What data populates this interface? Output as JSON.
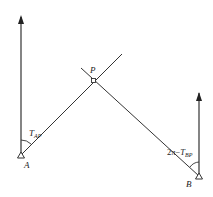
{
  "diagram": {
    "points": {
      "A": {
        "label": "A"
      },
      "B": {
        "label": "B"
      },
      "P": {
        "label": "P"
      }
    },
    "angles": {
      "at_A": {
        "main": "T",
        "sub": "AP"
      },
      "at_B": {
        "prefix": "2π−",
        "main": "T",
        "sub": "BP"
      }
    },
    "colors": {
      "line": "#333333",
      "background": "#ffffff"
    }
  }
}
